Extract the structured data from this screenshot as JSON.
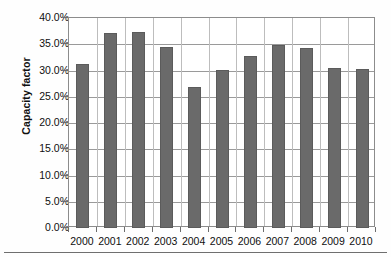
{
  "chart_data": {
    "type": "bar",
    "title": "",
    "subtitle": "",
    "xlabel": "",
    "ylabel": "Capacity factor",
    "categories": [
      "2000",
      "2001",
      "2002",
      "2003",
      "2004",
      "2005",
      "2006",
      "2007",
      "2008",
      "2009",
      "2010"
    ],
    "values": [
      31.3,
      37.1,
      37.3,
      34.5,
      26.9,
      30.1,
      32.8,
      34.9,
      34.3,
      30.5,
      30.2
    ],
    "value_labels": [
      "31.3%",
      "37.1%",
      "37.3%",
      "34.5%",
      "26.9%",
      "30.1%",
      "32.8%",
      "34.9%",
      "34.3%",
      "30.5%",
      "30.2%"
    ],
    "ylim": [
      0,
      40
    ],
    "ytick_values": [
      0,
      5,
      10,
      15,
      20,
      25,
      30,
      35,
      40
    ],
    "ytick_labels": [
      "0.0%",
      "5.0%",
      "10.0%",
      "15.0%",
      "20.0%",
      "25.0%",
      "30.0%",
      "35.0%",
      "40.0%"
    ],
    "grid": "horizontal-and-category-separators",
    "legend": "none",
    "series": [
      {
        "name": "Capacity factor",
        "color": "#6a6a6a",
        "values": [
          31.3,
          37.1,
          37.3,
          34.5,
          26.9,
          30.1,
          32.8,
          34.9,
          34.3,
          30.5,
          30.2
        ]
      }
    ]
  },
  "colors": {
    "bar_fill": "#6a6a6a",
    "bar_border": "#5b5b5b",
    "grid_line": "#9a9a9a",
    "category_separator": "#bdbdbd",
    "axis_frame": "#8c8c8c",
    "text": "#0f0f0f",
    "plot_background": "#ffffff",
    "page_background": "#fefefe"
  }
}
